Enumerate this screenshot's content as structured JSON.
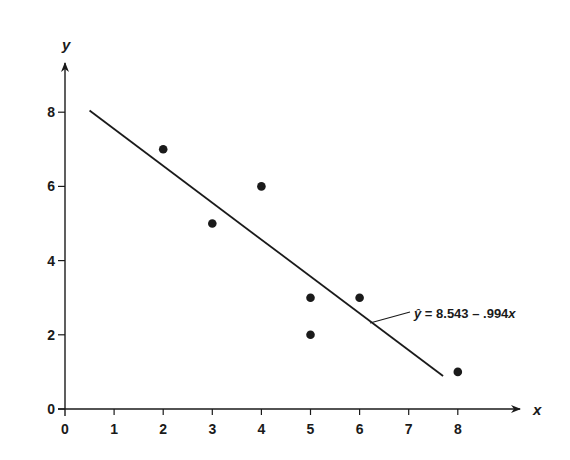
{
  "chart_data": {
    "type": "scatter",
    "title": "",
    "xlabel": "x",
    "ylabel": "y",
    "xlim": [
      0,
      9
    ],
    "ylim": [
      0,
      9
    ],
    "x_ticks": [
      "0",
      "1",
      "2",
      "3",
      "4",
      "5",
      "6",
      "7",
      "8"
    ],
    "y_ticks": [
      "0",
      "2",
      "4",
      "6",
      "8"
    ],
    "grid": false,
    "series": [
      {
        "name": "observations",
        "points": [
          {
            "x": 2,
            "y": 7
          },
          {
            "x": 3,
            "y": 5
          },
          {
            "x": 4,
            "y": 6
          },
          {
            "x": 5,
            "y": 3
          },
          {
            "x": 5,
            "y": 2
          },
          {
            "x": 6,
            "y": 3
          },
          {
            "x": 8,
            "y": 1
          }
        ]
      }
    ],
    "regression_line": {
      "intercept": 8.543,
      "slope": -0.994,
      "x_range": [
        0.5,
        7.7
      ]
    },
    "annotations": [
      {
        "text_hat": "ŷ",
        "text_rest": " = 8.543 – .994",
        "text_var": "x"
      }
    ],
    "colors": {
      "ink": "#1a1a1a",
      "background": "#ffffff"
    }
  }
}
